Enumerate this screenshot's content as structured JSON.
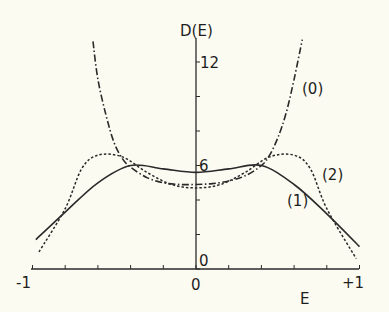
{
  "chart_data": {
    "type": "line",
    "title": "",
    "xlabel": "E",
    "ylabel": "D(E)",
    "xlim": [
      -1,
      1
    ],
    "ylim": [
      0,
      13.5
    ],
    "x_ticks": [
      -1,
      -0.8,
      -0.6,
      -0.4,
      -0.2,
      0,
      0.2,
      0.4,
      0.6,
      0.8,
      1
    ],
    "x_tick_labels": {
      "-1": "-1",
      "0": "0",
      "1": "+1"
    },
    "y_ticks": [
      0,
      2,
      4,
      6,
      8,
      10,
      12
    ],
    "y_tick_labels": {
      "0": "0",
      "6": "6",
      "12": "12"
    },
    "grid": false,
    "legend": "inline curve labels",
    "series": [
      {
        "name": "(0)",
        "style": "dash-dot",
        "x": [
          -0.63,
          -0.6,
          -0.55,
          -0.5,
          -0.45,
          -0.4,
          -0.3,
          -0.2,
          -0.1,
          0,
          0.1,
          0.2,
          0.3,
          0.4,
          0.45,
          0.5,
          0.55,
          0.6,
          0.65
        ],
        "y": [
          13.2,
          11.0,
          8.9,
          7.3,
          6.4,
          5.9,
          5.3,
          5.0,
          4.9,
          4.9,
          4.95,
          5.1,
          5.4,
          6.0,
          6.6,
          7.6,
          9.0,
          11.0,
          13.3
        ]
      },
      {
        "name": "(1)",
        "style": "solid",
        "x": [
          -0.98,
          -0.8,
          -0.6,
          -0.4,
          -0.2,
          0,
          0.2,
          0.4,
          0.6,
          0.8,
          1.0
        ],
        "y": [
          1.7,
          3.3,
          5.0,
          6.0,
          5.8,
          5.6,
          5.8,
          6.0,
          4.9,
          3.2,
          1.3
        ]
      },
      {
        "name": "(2)",
        "style": "dotted",
        "x": [
          -0.96,
          -0.8,
          -0.7,
          -0.6,
          -0.45,
          -0.3,
          -0.15,
          0,
          0.15,
          0.3,
          0.45,
          0.6,
          0.7,
          0.8,
          0.98
        ],
        "y": [
          1.0,
          3.5,
          5.8,
          6.6,
          6.5,
          5.6,
          4.9,
          4.7,
          4.9,
          5.6,
          6.5,
          6.6,
          5.8,
          3.5,
          0.6
        ]
      }
    ],
    "annotations": [
      {
        "text": "(0)",
        "x": 0.73,
        "y": 10.8
      },
      {
        "text": "(2)",
        "x": 0.8,
        "y": 5.6
      },
      {
        "text": "(1)",
        "x": 0.53,
        "y": 3.8
      }
    ]
  },
  "labels": {
    "y_axis_title": "D(E)",
    "x_axis_title": "E",
    "x_minus1": "-1",
    "x_zero": "0",
    "x_plus1": "+1",
    "y_zero": "0",
    "y_six": "6",
    "y_twelve": "12",
    "curve0": "(0)",
    "curve1": "(1)",
    "curve2": "(2)"
  }
}
